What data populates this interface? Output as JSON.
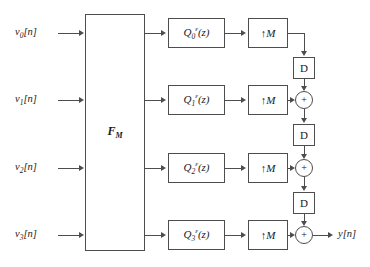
{
  "diagram": {
    "line_color": "#4d4d4d",
    "text_color": "#1a1a1a",
    "background": "#ffffff"
  },
  "inputs": [
    {
      "label": "v",
      "index": "0",
      "suffix": "[n]",
      "full": "v0[n]"
    },
    {
      "label": "v",
      "index": "1",
      "suffix": "[n]",
      "full": "v1[n]"
    },
    {
      "label": "v",
      "index": "2",
      "suffix": "[n]",
      "full": "v2[n]"
    },
    {
      "label": "v",
      "index": "3",
      "suffix": "[n]",
      "full": "v3[n]"
    }
  ],
  "matrix_block": {
    "name": "F",
    "subscript": "M",
    "full": "F_M"
  },
  "filters": [
    {
      "name": "Q",
      "subscript": "0",
      "superscript": "ε",
      "arg": "(z)",
      "full": "Q0^e(z)"
    },
    {
      "name": "Q",
      "subscript": "1",
      "superscript": "ε",
      "arg": "(z)",
      "full": "Q1^e(z)"
    },
    {
      "name": "Q",
      "subscript": "2",
      "superscript": "ε",
      "arg": "(z)",
      "full": "Q2^e(z)"
    },
    {
      "name": "Q",
      "subscript": "3",
      "superscript": "ε",
      "arg": "(z)",
      "full": "Q3^e(z)"
    }
  ],
  "upsamplers": [
    {
      "arrow": "↑",
      "factor": "M",
      "full": "↑M"
    },
    {
      "arrow": "↑",
      "factor": "M",
      "full": "↑M"
    },
    {
      "arrow": "↑",
      "factor": "M",
      "full": "↑M"
    },
    {
      "arrow": "↑",
      "factor": "M",
      "full": "↑M"
    }
  ],
  "delays": [
    {
      "label": "D"
    },
    {
      "label": "D"
    },
    {
      "label": "D"
    }
  ],
  "adders": [
    {
      "sign": "+"
    },
    {
      "sign": "+"
    },
    {
      "sign": "+"
    }
  ],
  "output": {
    "label": "y",
    "suffix": "[n]",
    "full": "y[n]"
  }
}
